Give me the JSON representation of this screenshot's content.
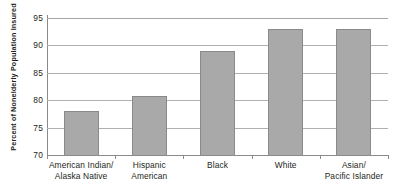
{
  "chart_data": {
    "type": "bar",
    "title": "",
    "subtitle": "",
    "xlabel": "",
    "ylabel": "Percent of Nonelderly Population Insured",
    "categories": [
      "American Indian/\nAlaska Native",
      "Hispanic\nAmerican",
      "Black",
      "White",
      "Asian/\nPacific Islander"
    ],
    "category_lines": [
      [
        "American Indian/",
        "Alaska Native"
      ],
      [
        "Hispanic",
        "American"
      ],
      [
        "Black"
      ],
      [
        "White"
      ],
      [
        "Asian/",
        "Pacific Islander"
      ]
    ],
    "values": [
      78.0,
      80.8,
      89.0,
      93.0,
      93.0
    ],
    "ylim": [
      70,
      95
    ],
    "yticks": [
      70,
      75,
      80,
      85,
      90,
      95
    ],
    "ytick_labels": [
      "70",
      "75",
      "80",
      "85",
      "90",
      "95"
    ],
    "grid": true,
    "legend": false,
    "legend_position": "none",
    "bar_color": "#a9a9a9",
    "bar_border_color": "#8a8a8a",
    "gridline_color": "#b0b0b0",
    "axis_color": "#8b8b8b",
    "text_color": "#231f20",
    "background": "#ffffff"
  }
}
